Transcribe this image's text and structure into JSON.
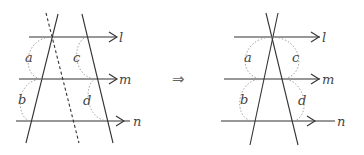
{
  "diagram": {
    "implies_symbol": "⇒",
    "left_panel": {
      "lines": [
        {
          "name": "l",
          "label": "l"
        },
        {
          "name": "m",
          "label": "m"
        },
        {
          "name": "n",
          "label": "n"
        }
      ],
      "segments": [
        "a",
        "b",
        "c",
        "d"
      ],
      "has_dashed_parallel": true
    },
    "right_panel": {
      "lines": [
        {
          "name": "l",
          "label": "l"
        },
        {
          "name": "m",
          "label": "m"
        },
        {
          "name": "n",
          "label": "n"
        }
      ],
      "segments": [
        "a",
        "b",
        "c",
        "d"
      ]
    }
  }
}
